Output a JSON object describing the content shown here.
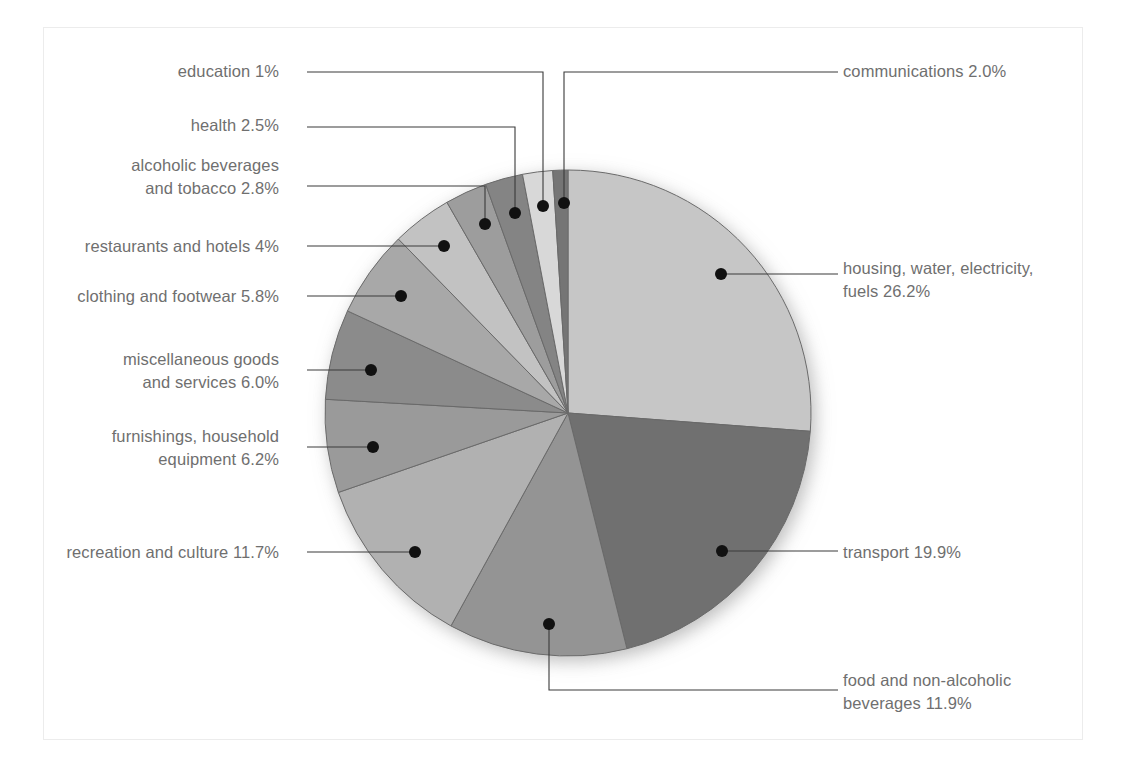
{
  "chart_data": {
    "type": "pie",
    "title": "",
    "subtitle": "",
    "xlabel": "",
    "ylabel": "",
    "legend_position": "callout-labels",
    "grid": false,
    "start_angle_deg": 0,
    "direction": "clockwise",
    "units": "percent",
    "categories": [
      "housing, water, electricity, fuels",
      "transport",
      "food and non-alcoholic beverages",
      "recreation and culture",
      "furnishings, household equipment",
      "miscellaneous goods and services",
      "clothing and footwear",
      "restaurants and hotels",
      "alcoholic beverages and tobacco",
      "health",
      "communications",
      "education"
    ],
    "values": [
      26.2,
      19.9,
      11.9,
      11.7,
      6.2,
      6.0,
      5.8,
      4.0,
      2.8,
      2.5,
      2.0,
      1.0
    ],
    "colors": [
      "#c6c6c6",
      "#6f6f6f",
      "#949494",
      "#b1b1b1",
      "#9a9a9a",
      "#8b8b8b",
      "#a8a8a8",
      "#c2c2c2",
      "#9d9d9d",
      "#848484",
      "#d8d8d8",
      "#747474"
    ],
    "slice_labels": [
      "housing, water, electricity,\nfuels 26.2%",
      "transport 19.9%",
      "food and non-alcoholic\nbeverages 11.9%",
      "recreation and culture 11.7%",
      "furnishings, household\nequipment 6.2%",
      "miscellaneous goods\nand services 6.0%",
      "clothing and footwear 5.8%",
      "restaurants and hotels 4%",
      "alcoholic beverages\nand tobacco 2.8%",
      "health 2.5%",
      "communications 2.0%",
      "education 1%"
    ]
  },
  "labels": {
    "communications": "communications 2.0%",
    "housing": "housing, water, electricity,\nfuels 26.2%",
    "transport": "transport 19.9%",
    "food": "food and non-alcoholic\nbeverages 11.9%",
    "education": "education 1%",
    "health": "health 2.5%",
    "alcoholic": "alcoholic beverages\nand tobacco 2.8%",
    "restaurants": "restaurants and hotels 4%",
    "clothing": "clothing and footwear 5.8%",
    "miscellaneous": "miscellaneous goods\nand services 6.0%",
    "furnishings": "furnishings, household\nequipment 6.2%",
    "recreation": "recreation and culture 11.7%"
  },
  "style": {
    "text_color": "#6f6f6f",
    "leader_color": "#3a3a3a",
    "dot_color": "#111111",
    "slice_stroke": "#6a6a6a",
    "frame_color": "#ececec",
    "background": "#ffffff"
  }
}
